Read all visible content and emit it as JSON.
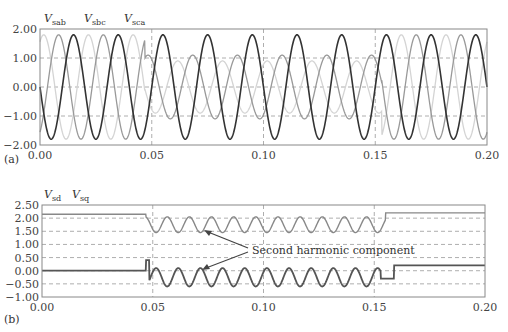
{
  "chart_data": [
    {
      "panel": "(a)",
      "type": "line",
      "title": "",
      "xlabel": "",
      "ylabel": "",
      "xlim": [
        0.0,
        0.2
      ],
      "ylim": [
        -2.0,
        2.0
      ],
      "x_ticks": [
        "0.00",
        "0.05",
        "0.10",
        "0.15",
        "0.20"
      ],
      "y_ticks": [
        "2.00",
        "1.00",
        "0.00",
        "-1.00",
        "-2.00"
      ],
      "grid": true,
      "legend": [
        "V_sab",
        "V_sbc",
        "V_sca"
      ],
      "frequency_hz": 50,
      "series": [
        {
          "name": "V_sab",
          "color": "#999999",
          "amplitude_balanced": 1.8,
          "amplitude_unbalanced": 1.1,
          "phase_deg": 120
        },
        {
          "name": "V_sbc",
          "color": "#333333",
          "amplitude_balanced": 1.8,
          "amplitude_unbalanced": 1.8,
          "phase_deg": 0
        },
        {
          "name": "V_sca",
          "color": "#d4d4d4",
          "amplitude_balanced": 1.8,
          "amplitude_unbalanced": 0.9,
          "phase_deg": -120
        }
      ],
      "unbalance_interval": [
        0.047,
        0.153
      ]
    },
    {
      "panel": "(b)",
      "type": "line",
      "title": "",
      "xlabel": "",
      "ylabel": "",
      "xlim": [
        0.0,
        0.2
      ],
      "ylim": [
        -1.0,
        2.5
      ],
      "x_ticks": [
        "0.00",
        "0.05",
        "0.10",
        "0.15",
        "0.20"
      ],
      "y_ticks": [
        "2.50",
        "2.00",
        "1.50",
        "1.00",
        "0.50",
        "0.00",
        "-0.50",
        "-1.00"
      ],
      "grid": true,
      "legend": [
        "V_sd",
        "V_sq"
      ],
      "annotations": [
        "Second harmonic component"
      ],
      "series": [
        {
          "name": "V_sd",
          "color": "#888888",
          "pre_value": 2.15,
          "mean_during": 1.75,
          "osc_amplitude": 0.3,
          "osc_frequency_hz": 100,
          "post_value": 2.2
        },
        {
          "name": "V_sq",
          "color": "#555555",
          "pre_value": 0.0,
          "spike_at": 0.047,
          "spike_value": 0.4,
          "mean_during": -0.25,
          "osc_amplitude": 0.35,
          "osc_frequency_hz": 100,
          "step_value": -0.3,
          "post_value": 0.2
        }
      ],
      "disturbance_interval": [
        0.047,
        0.155
      ]
    }
  ],
  "labels": {
    "a": {
      "panel": "(a)",
      "legend": [
        {
          "v": "V",
          "s": "sab"
        },
        {
          "v": "V",
          "s": "sbc"
        },
        {
          "v": "V",
          "s": "sca"
        }
      ]
    },
    "b": {
      "panel": "(b)",
      "legend": [
        {
          "v": "V",
          "s": "sd"
        },
        {
          "v": "V",
          "s": "sq"
        }
      ],
      "annotation": "Second harmonic component"
    }
  }
}
